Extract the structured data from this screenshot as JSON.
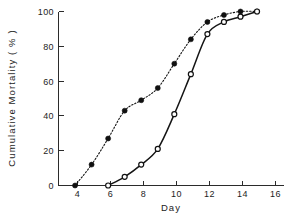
{
  "chart_data": {
    "type": "line",
    "title": "",
    "subtitle": "",
    "xlabel": "Day",
    "ylabel": "Cumulative Mortality ( % )",
    "xlim": [
      3,
      16.6
    ],
    "ylim": [
      0,
      100
    ],
    "xticks": [
      4,
      6,
      8,
      10,
      12,
      14,
      16
    ],
    "xticklabels": [
      "4",
      "6",
      "8",
      "10",
      "12",
      "14",
      "16"
    ],
    "yticks": [
      0,
      20,
      40,
      60,
      80,
      100
    ],
    "yticklabels": [
      "0",
      "20",
      "40",
      "60",
      "80",
      "100"
    ],
    "grid": false,
    "legend": "none",
    "series": [
      {
        "name": "filled-circle-dotted",
        "marker": "filled circle",
        "linestyle": "dotted",
        "color": "#101010",
        "x": [
          4,
          5,
          6,
          7,
          8,
          9,
          10,
          11,
          12,
          13,
          14,
          15
        ],
        "values": [
          0,
          12,
          27,
          43,
          49,
          56,
          70,
          84,
          94,
          98,
          100,
          100
        ]
      },
      {
        "name": "open-circle-solid",
        "marker": "open circle",
        "linestyle": "solid",
        "color": "#101010",
        "x": [
          6,
          7,
          8,
          9,
          10,
          11,
          12,
          13,
          14,
          15
        ],
        "values": [
          0,
          5,
          12,
          21,
          41,
          64,
          87,
          94,
          97,
          100
        ]
      }
    ]
  },
  "axis_labels": {
    "x_title": "Day",
    "y_title": "Cumulative Mortality ( % )"
  }
}
